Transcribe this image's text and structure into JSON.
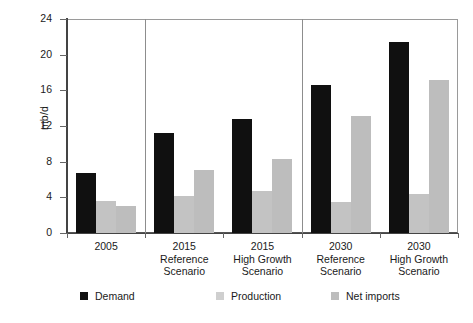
{
  "chart_data": {
    "type": "bar",
    "title": "",
    "xlabel": "",
    "ylabel": "mb/d",
    "ylim": [
      0,
      24
    ],
    "yticks": [
      0,
      4,
      8,
      12,
      16,
      20,
      24
    ],
    "grid": false,
    "legend_position": "bottom",
    "categories": [
      "2005",
      "2015 Reference Scenario",
      "2015 High Growth Scenario",
      "2030 Reference Scenario",
      "2030 High Growth Scenario"
    ],
    "category_lines": [
      [
        "2005"
      ],
      [
        "2015",
        "Reference",
        "Scenario"
      ],
      [
        "2015",
        "High Growth",
        "Scenario"
      ],
      [
        "2030",
        "Reference",
        "Scenario"
      ],
      [
        "2030",
        "High Growth",
        "Scenario"
      ]
    ],
    "series": [
      {
        "name": "Demand",
        "color": "#101010",
        "values": [
          6.7,
          11.2,
          12.8,
          16.6,
          21.4
        ]
      },
      {
        "name": "Production",
        "color": "#c3c3c3",
        "values": [
          3.6,
          4.1,
          4.7,
          3.5,
          4.4
        ]
      },
      {
        "name": "Net imports",
        "color": "#bdbdbd",
        "values": [
          3.0,
          7.1,
          8.3,
          13.1,
          17.2
        ]
      }
    ],
    "group_separators_after": [
      0,
      2
    ]
  },
  "axis": {
    "y_title": "mb/d",
    "tick_labels": [
      "24",
      "20",
      "16",
      "12",
      "8",
      "4",
      "0"
    ]
  },
  "legend": {
    "items": [
      {
        "label": "Demand",
        "swatch": "legend-swatch-demand"
      },
      {
        "label": "Production",
        "swatch": "legend-swatch-production"
      },
      {
        "label": "Net imports",
        "swatch": "legend-swatch-net-imports"
      }
    ]
  }
}
